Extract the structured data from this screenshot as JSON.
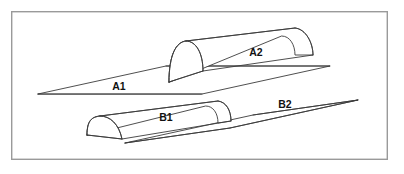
{
  "figure": {
    "width": 404,
    "height": 174,
    "background_color": "#ffffff",
    "line_color": "#3b3b3b",
    "frame_color": "#9a9a9a"
  },
  "frame": {
    "name": "figure-border",
    "x": 11,
    "y": 11,
    "width": 377,
    "height": 149
  },
  "labels": {
    "a1": "A1",
    "a2": "A2",
    "b1": "B1",
    "b2": "B2"
  },
  "label_positions": {
    "a1": {
      "x": 119,
      "y": 87
    },
    "a2": {
      "x": 256,
      "y": 53
    },
    "b1": {
      "x": 166,
      "y": 118
    },
    "b2": {
      "x": 285,
      "y": 105
    }
  },
  "geometry": {
    "plane_a": {
      "name": "upper-plane",
      "label_flat_region": "A1",
      "label_solid_region": "A2",
      "points": "38,94 166,66 330,66 202,94"
    },
    "plane_b": {
      "name": "lower-plane",
      "label_flat_region": "B1",
      "label_solid_region": "B2",
      "points": "125,143 253,115 358,100 230,128"
    },
    "half_cylinder_a2": {
      "name": "upper-half-cylinder",
      "base_near_left": {
        "x": 169,
        "y": 82
      },
      "base_near_right": {
        "x": 295,
        "y": 55
      },
      "ridge_left": {
        "x": 186,
        "y": 41
      },
      "ridge_right": {
        "x": 295,
        "y": 28
      }
    },
    "half_cylinder_b1": {
      "name": "lower-half-cylinder",
      "base_near_left": {
        "x": 87,
        "y": 135
      },
      "base_near_right": {
        "x": 218,
        "y": 108
      },
      "ridge_left": {
        "x": 100,
        "y": 116
      },
      "ridge_right": {
        "x": 218,
        "y": 101
      }
    }
  }
}
